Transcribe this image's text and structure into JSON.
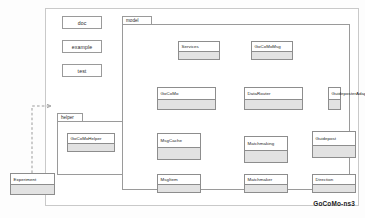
{
  "diagram": {
    "title": "GoCoMo-ns3",
    "type": "uml-package-diagram",
    "canvas": {
      "border_color": "#c9c9c9",
      "background": "#ffffff"
    },
    "style": {
      "class_header_fill": "#ffffff",
      "class_body_fill": "#e2e2e2",
      "class_border": "#8d8d8d",
      "package_border": "#9a9a9a",
      "dependency_line": "#8a8a8a",
      "inheritance_line": "#303030"
    }
  },
  "plain_boxes": [
    {
      "label": "doc"
    },
    {
      "label": "example"
    },
    {
      "label": "test"
    }
  ],
  "packages": [
    {
      "name": "helper",
      "tab_label": "helper"
    },
    {
      "name": "model",
      "tab_label": "model"
    }
  ],
  "classes": {
    "experiment": {
      "label": "Experiment"
    },
    "gocomohelper": {
      "label": "GoCoMoHelper"
    },
    "services": {
      "label": "Services"
    },
    "gocomomsg": {
      "label": "GoCoMoMsg"
    },
    "gocomo": {
      "label": "GoCoMo"
    },
    "datarouter": {
      "label": "DataRouter"
    },
    "guideposteradapter": {
      "label": "GuideposterAdapter"
    },
    "msgcache": {
      "label": "MsgCache"
    },
    "matchmaking": {
      "label": "Matchmaking"
    },
    "guidepost": {
      "label": "Guidepost"
    },
    "msgitem": {
      "label": "MsgItem"
    },
    "matchmaker": {
      "label": "Matchmaker"
    },
    "direction": {
      "label": "Direction"
    }
  },
  "relations": [
    {
      "from": "Experiment",
      "to": "helper-package",
      "type": "dependency"
    },
    {
      "from": "GoCoMoHelper",
      "to": "GoCoMo",
      "type": "dependency"
    },
    {
      "from": "GoCoMo",
      "to": "Services",
      "type": "realization"
    },
    {
      "from": "DataRouter",
      "to": "GoCoMoMsg",
      "type": "dependency"
    },
    {
      "from": "GoCoMo",
      "to": "DataRouter",
      "type": "dependency"
    },
    {
      "from": "DataRouter",
      "to": "GuideposterAdapter",
      "type": "dependency"
    },
    {
      "from": "GoCoMo",
      "to": "MsgCache",
      "type": "dependency"
    },
    {
      "from": "MsgCache",
      "to": "Matchmaking",
      "type": "dependency"
    },
    {
      "from": "DataRouter",
      "to": "Matchmaking",
      "type": "dependency"
    },
    {
      "from": "GuideposterAdapter",
      "to": "Guidepost",
      "type": "dependency"
    },
    {
      "from": "MsgCache",
      "to": "MsgItem",
      "type": "dependency"
    },
    {
      "from": "Matchmaking",
      "to": "Matchmaker",
      "type": "dependency"
    },
    {
      "from": "Direction",
      "to": "Guidepost",
      "type": "composition"
    }
  ]
}
